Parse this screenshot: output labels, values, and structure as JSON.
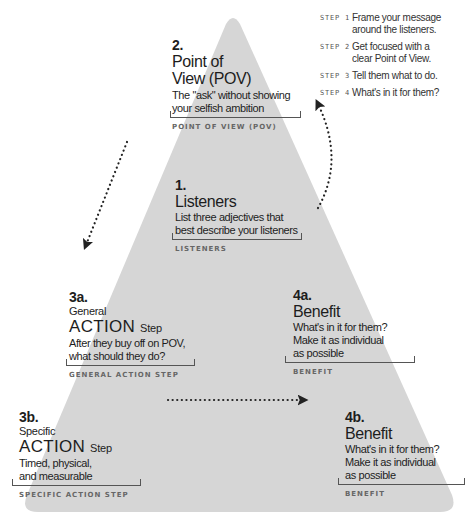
{
  "colors": {
    "triangle": "#d6d6d6",
    "text": "#1d1d1d",
    "caption": "#666666",
    "arrow": "#222222"
  },
  "steps": [
    {
      "label": "STEP 1",
      "text": "Frame your message around the listeners."
    },
    {
      "label": "STEP 2",
      "text": "Get focused with a clear Point of View."
    },
    {
      "label": "STEP 3",
      "text": "Tell them what to do."
    },
    {
      "label": "STEP 4",
      "text": "What's in it for them?"
    }
  ],
  "nodes": {
    "pov": {
      "number": "2.",
      "title_line1": "Point of",
      "title_line2": "View (POV)",
      "desc_line1": "The \"ask\" without showing",
      "desc_line2": "your selfish ambition",
      "caption": "POINT OF VIEW (POV)"
    },
    "listeners": {
      "number": "1.",
      "title": "Listeners",
      "desc_line1": "List three adjectives that",
      "desc_line2": "best describe your listeners",
      "caption": "LISTENERS"
    },
    "general_action": {
      "number": "3a.",
      "pre": "General",
      "action": "ACTION",
      "action_suffix": "Step",
      "desc_line1": "After they buy off on POV,",
      "desc_line2": "what should they do?",
      "caption": "GENERAL ACTION STEP"
    },
    "benefit_a": {
      "number": "4a.",
      "title": "Benefit",
      "desc_line1": "What's in it for them?",
      "desc_line2": "Make it as individual",
      "desc_line3": "as possible",
      "caption": "BENEFIT"
    },
    "specific_action": {
      "number": "3b.",
      "pre": "Specific",
      "action": "ACTION",
      "action_suffix": "Step",
      "desc_line1": "Timed, physical,",
      "desc_line2": "and measurable",
      "caption": "SPECIFIC ACTION STEP"
    },
    "benefit_b": {
      "number": "4b.",
      "title": "Benefit",
      "desc_line1": "What's in it for them?",
      "desc_line2": "Make it as individual",
      "desc_line3": "as possible",
      "caption": "BENEFIT"
    }
  },
  "arrows": [
    {
      "name": "listeners-to-pov",
      "icon": "dotted-arrow-icon"
    },
    {
      "name": "pov-to-general-action",
      "icon": "dotted-arrow-icon"
    },
    {
      "name": "specific-action-to-benefit",
      "icon": "dotted-arrow-icon"
    }
  ]
}
